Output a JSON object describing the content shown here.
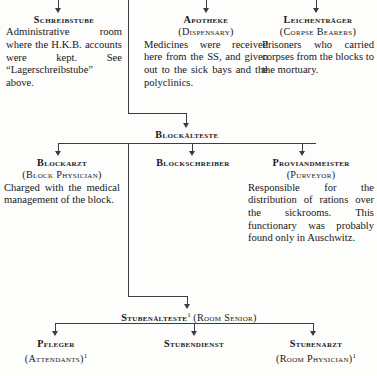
{
  "diagram": {
    "type": "organizational-tree",
    "line_color": "#3b3b40",
    "text_color": "#17171a",
    "background_color": "#fdfdfc"
  },
  "row1": {
    "schreibstube": {
      "heading": "Schreibstube",
      "subheading": "",
      "body": "Administrative room where the H.K.B. accounts were kept. See “Lagerschreibstube” above."
    },
    "apotheke": {
      "heading": "Apotheke",
      "subheading": "(Dispensary)",
      "body": "Medicines were received here from the SS, and given out to the sick bays and the polyclinics."
    },
    "leichentraeger": {
      "heading": "Leichenträger",
      "subheading": "(Corpse Bearers)",
      "body": "Prisoners who carried corpses from the blocks to the mortuary."
    }
  },
  "row2": {
    "blockaelteste": {
      "heading": "Blockälteste"
    }
  },
  "row3": {
    "blockarzt": {
      "heading": "Blockarzt",
      "subheading": "(Block Physician)",
      "body": "Charged with the medical management of the block."
    },
    "blockschreiber": {
      "heading": "Blockschreiber",
      "subheading": "",
      "body": ""
    },
    "proviandmeister": {
      "heading": "Proviandmeister",
      "subheading": "(Purveyor)",
      "body": "Responsible for the distribution of rations over the sickrooms. This functionary was probably found only in Auschwitz."
    }
  },
  "row4": {
    "stubenaelteste": {
      "heading": "Stubenälteste",
      "footnote": "1",
      "translation": "(Room Senior)"
    }
  },
  "row5": {
    "pfleger": {
      "heading": "Pfleger",
      "subheading": "(Attendants)",
      "footnote": "1"
    },
    "stubendienst": {
      "heading": "Stubendienst",
      "subheading": "",
      "footnote": ""
    },
    "stubenarzt": {
      "heading": "Stubenarzt",
      "subheading": "(Room Physician)",
      "footnote": "1"
    }
  }
}
